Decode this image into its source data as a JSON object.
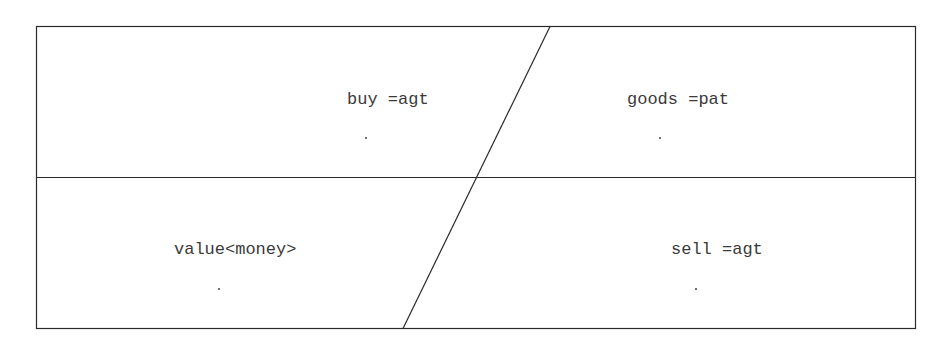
{
  "diagram": {
    "type": "quadrant-frame",
    "stroke_color": "#2a2a2a",
    "cells": [
      {
        "id": "top-left",
        "label": "buy =agt"
      },
      {
        "id": "top-right",
        "label": "goods =pat"
      },
      {
        "id": "bottom-left",
        "label": "value<money>"
      },
      {
        "id": "bottom-right",
        "label": "sell =agt"
      }
    ]
  }
}
